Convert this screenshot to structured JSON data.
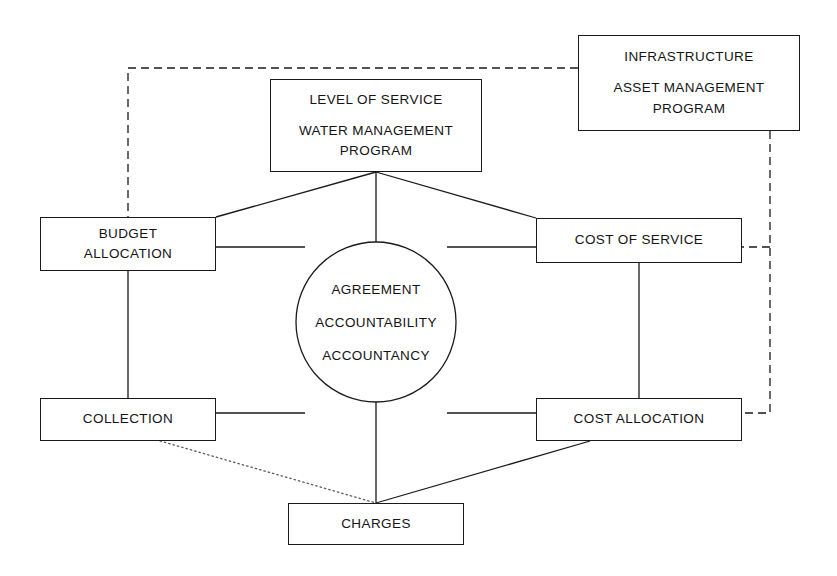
{
  "diagram": {
    "type": "flow-diagram",
    "background_color": "#ffffff",
    "stroke_color": "#1a1a1a",
    "text_color": "#141414",
    "nodes": {
      "level_of_service": {
        "line1": "LEVEL OF SERVICE",
        "line2": "WATER MANAGEMENT",
        "line3": "PROGRAM"
      },
      "infrastructure": {
        "line1": "INFRASTRUCTURE",
        "line2": "ASSET MANAGEMENT",
        "line3": "PROGRAM"
      },
      "budget_allocation": {
        "line1": "BUDGET",
        "line2": "ALLOCATION"
      },
      "cost_of_service": {
        "line1": "COST OF SERVICE"
      },
      "collection": {
        "line1": "COLLECTION"
      },
      "cost_allocation": {
        "line1": "COST ALLOCATION"
      },
      "charges": {
        "line1": "CHARGES"
      },
      "center_circle": {
        "line1": "AGREEMENT",
        "line2": "ACCOUNTABILITY",
        "line3": "ACCOUNTANCY"
      }
    },
    "connectors": [
      {
        "name": "los-to-budget-allocation",
        "style": "solid"
      },
      {
        "name": "los-to-cost-of-service",
        "style": "solid"
      },
      {
        "name": "los-to-circle",
        "style": "solid"
      },
      {
        "name": "budget-allocation-to-circle",
        "style": "solid"
      },
      {
        "name": "cost-of-service-to-circle",
        "style": "solid"
      },
      {
        "name": "collection-to-circle",
        "style": "solid"
      },
      {
        "name": "cost-allocation-to-circle",
        "style": "solid"
      },
      {
        "name": "budget-allocation-to-collection",
        "style": "solid"
      },
      {
        "name": "cost-of-service-to-cost-allocation",
        "style": "solid"
      },
      {
        "name": "circle-to-charges",
        "style": "solid"
      },
      {
        "name": "cost-allocation-to-charges",
        "style": "solid"
      },
      {
        "name": "collection-to-charges",
        "style": "dotted"
      },
      {
        "name": "infrastructure-to-budget-allocation",
        "style": "dashed"
      },
      {
        "name": "infrastructure-to-cost-of-service",
        "style": "dashed"
      },
      {
        "name": "infrastructure-to-cost-allocation",
        "style": "dashed"
      }
    ]
  }
}
